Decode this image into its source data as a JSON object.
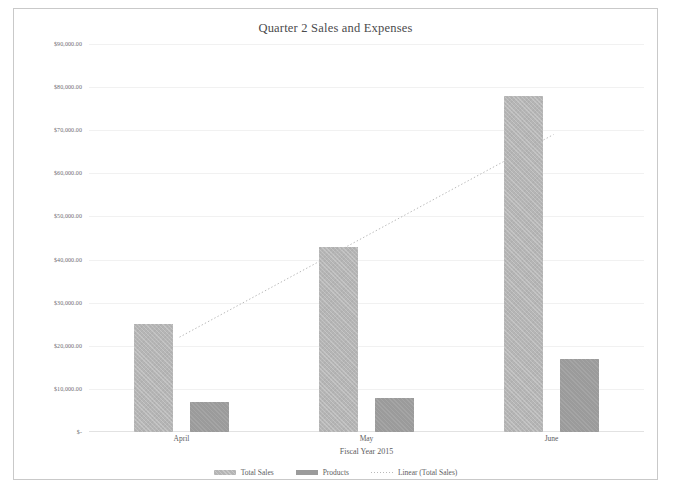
{
  "chart_data": {
    "type": "bar",
    "title": "Quarter 2 Sales and Expenses",
    "xlabel": "Fiscal Year 2015",
    "ylabel": "",
    "categories": [
      "April",
      "May",
      "June"
    ],
    "series": [
      {
        "name": "Total Sales",
        "values": [
          25000,
          43000,
          78000
        ],
        "color": "#b5b5b5"
      },
      {
        "name": "Products",
        "values": [
          7000,
          8000,
          17000
        ],
        "color": "#9b9b9b"
      }
    ],
    "trendline": {
      "name": "Linear (Total Sales)",
      "style": "dotted",
      "color": "#b9b9b9",
      "start_value": 22000,
      "end_value": 69000
    },
    "ylim": [
      0,
      90000
    ],
    "ytick_values": [
      0,
      10000,
      20000,
      30000,
      40000,
      50000,
      60000,
      70000,
      80000,
      90000
    ],
    "ytick_labels": [
      "$-",
      "$10,000.00",
      "$20,000.00",
      "$30,000.00",
      "$40,000.00",
      "$50,000.00",
      "$60,000.00",
      "$70,000.00",
      "$80,000.00",
      "$90,000.00"
    ],
    "grid": true,
    "legend_position": "bottom",
    "legend_entries": [
      "Total Sales",
      "Products",
      "Linear (Total Sales)"
    ],
    "plot_background": "#ffffff",
    "border_color": "#c9c9c9"
  }
}
